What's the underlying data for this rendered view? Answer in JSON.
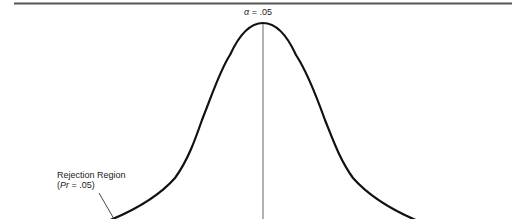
{
  "diagram": {
    "type": "normal-distribution-curve",
    "alpha_symbol": "α",
    "alpha_value": " = .05",
    "rejection_region": {
      "title": "Rejection Region",
      "open_paren": "(",
      "pr_symbol": "Pr",
      "pr_value": " = .05)"
    },
    "colors": {
      "curve": "#111111",
      "rule": "#555555",
      "center_line": "#555555",
      "text": "#222222"
    }
  }
}
